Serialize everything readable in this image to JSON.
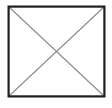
{
  "figure": {
    "type": "geometric-diagram",
    "canvas": {
      "width": 112,
      "height": 108,
      "background_color": "#ffffff"
    },
    "square": {
      "name": "square-outline",
      "left": 7.5,
      "top": 5.5,
      "right": 105.5,
      "bottom": 97.5,
      "width": 98,
      "height": 92,
      "stroke_color": "#1e1e1e",
      "stroke_width": 2.2,
      "fill_color": "#ffffff"
    },
    "diagonals": {
      "stroke_color": "#8a8a8a",
      "stroke_width": 1.1,
      "intersection": {
        "x": 56.5,
        "y": 51.5
      },
      "lines": [
        {
          "name": "diagonal-top-left-to-bottom-right",
          "x1": 9,
          "y1": 7,
          "x2": 104,
          "y2": 96
        },
        {
          "name": "diagonal-top-right-to-bottom-left",
          "x1": 104,
          "y1": 7,
          "x2": 9,
          "y2": 96
        }
      ]
    }
  }
}
